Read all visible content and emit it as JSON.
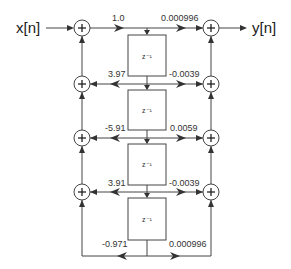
{
  "diagram": {
    "type": "signal-flow",
    "input_label": "x[n]",
    "output_label": "y[n]",
    "delay_label": "z⁻¹",
    "stages": [
      {
        "index": 0,
        "feedback_coef": "1.0",
        "feedforward_coef": "0.000996"
      },
      {
        "index": 1,
        "feedback_coef": "3.97",
        "feedforward_coef": "-0.0039"
      },
      {
        "index": 2,
        "feedback_coef": "-5.91",
        "feedforward_coef": "0.0059"
      },
      {
        "index": 3,
        "feedback_coef": "3.91",
        "feedforward_coef": "-0.0039"
      },
      {
        "index": 4,
        "feedback_coef": "-0.971",
        "feedforward_coef": "0.000996"
      }
    ],
    "delays": [
      {
        "label": "z⁻¹"
      },
      {
        "label": "z⁻¹"
      },
      {
        "label": "z⁻¹"
      },
      {
        "label": "z⁻¹"
      }
    ],
    "adders": {
      "left_count": 4,
      "right_count": 4,
      "symbol": "+"
    },
    "colors": {
      "line": "#444444",
      "text": "#333333",
      "background": "#ffffff"
    }
  }
}
